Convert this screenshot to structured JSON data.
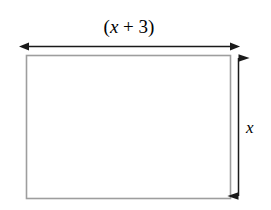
{
  "figure": {
    "type": "geometry-diagram",
    "shape": "rectangle",
    "title": "",
    "background_color": "#ffffff",
    "shape_fill_color": "#ffffff",
    "shape_stroke_color": "#9e9e9e",
    "arrow_color": "#1a1a1a",
    "labels": {
      "width": {
        "text": "(x + 3)",
        "open_paren": "(",
        "variable": "x",
        "operator": " + ",
        "constant": "3",
        "close_paren": ")",
        "position": "top",
        "style": "italic-variable"
      },
      "height": {
        "text": "x",
        "variable": "x",
        "position": "right",
        "style": "italic"
      }
    },
    "annotations": {
      "width_arrow": "double-headed-horizontal-arrow",
      "height_arrow": "double-headed-vertical-arrow"
    },
    "geometry": {
      "rect_x": 26,
      "rect_y": 55,
      "rect_width": 205,
      "rect_height": 144,
      "width_arrow_y": 46,
      "width_arrow_x1": 29,
      "width_arrow_x2": 230,
      "height_arrow_x": 239,
      "height_arrow_y1": 58,
      "height_arrow_y2": 196
    }
  }
}
